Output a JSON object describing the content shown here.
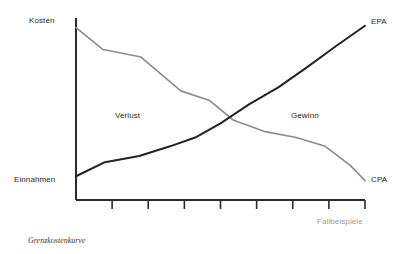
{
  "figure": {
    "caption": "Grenzkostenkurve",
    "background_color": "#ffffff"
  },
  "axes": {
    "y_top_label": "Kosten",
    "y_bottom_label": "Einnahmen",
    "x_label": "Fallbeispiele",
    "x_label_color": "#9a9a9a",
    "axis_color": "#2b2b2b",
    "axis_width_px": 2,
    "tick_count": 7,
    "grid": false
  },
  "regions": {
    "left_label": "Verlust",
    "right_label": "Gewinn"
  },
  "series_labels": {
    "epa": "EPA",
    "cpa": "CPA"
  },
  "chart_data": {
    "type": "line",
    "title": "Grenzkostenkurve",
    "xlabel": "Fallbeispiele",
    "ylabel": "",
    "ytick_labels": [
      "Einnahmen",
      "Kosten"
    ],
    "xlim": [
      0,
      8
    ],
    "ylim": [
      0,
      10
    ],
    "grid": false,
    "legend": "inline-end-of-line",
    "annotations": [
      {
        "text": "Verlust",
        "x": 1.35,
        "y": 5.3
      },
      {
        "text": "Gewinn",
        "x": 6.0,
        "y": 5.3
      }
    ],
    "series": [
      {
        "name": "CPA",
        "label": "CPA",
        "color": "#8c8c8c",
        "width_px": 1.6,
        "x": [
          0.0,
          0.75,
          1.8,
          2.9,
          3.7,
          4.35,
          5.2,
          6.1,
          6.9,
          7.6,
          8.0
        ],
        "y": [
          9.8,
          8.55,
          8.12,
          6.2,
          5.65,
          4.55,
          3.9,
          3.55,
          3.05,
          1.95,
          1.1
        ]
      },
      {
        "name": "EPA",
        "label": "EPA",
        "color": "#232323",
        "width_px": 2.0,
        "x": [
          0.0,
          0.8,
          1.75,
          2.6,
          3.3,
          4.0,
          4.8,
          5.6,
          6.4,
          7.2,
          8.0
        ],
        "y": [
          1.35,
          2.15,
          2.5,
          3.05,
          3.55,
          4.35,
          5.45,
          6.4,
          7.55,
          8.75,
          9.9
        ]
      }
    ]
  }
}
